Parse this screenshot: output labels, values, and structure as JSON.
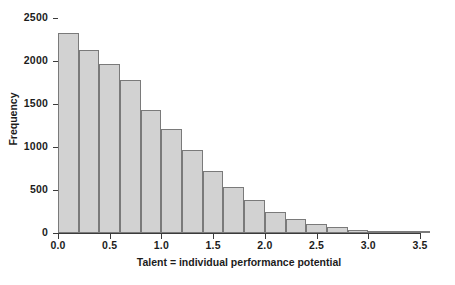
{
  "chart_data": {
    "type": "bar",
    "title": "",
    "subtitle": "",
    "xlabel": "Talent = individual performance potential",
    "ylabel": "Frequency",
    "xlim": [
      0.0,
      3.5
    ],
    "ylim": [
      0,
      2500
    ],
    "grid": false,
    "legend": null,
    "bin_width": 0.2,
    "x_tick_labels": [
      "0.0",
      "0.5",
      "1.0",
      "1.5",
      "2.0",
      "2.5",
      "3.0",
      "3.5"
    ],
    "x_tick_values": [
      0.0,
      0.5,
      1.0,
      1.5,
      2.0,
      2.5,
      3.0,
      3.5
    ],
    "y_tick_labels": [
      "0",
      "500",
      "1000",
      "1500",
      "2000",
      "2500"
    ],
    "y_tick_values": [
      0,
      500,
      1000,
      1500,
      2000,
      2500
    ],
    "bin_edges": [
      0.0,
      0.2,
      0.4,
      0.6,
      0.8,
      1.0,
      1.2,
      1.4,
      1.6,
      1.8,
      2.0,
      2.2,
      2.4,
      2.6,
      2.8,
      3.0,
      3.2,
      3.4,
      3.6
    ],
    "categories": [
      "0.0-0.2",
      "0.2-0.4",
      "0.4-0.6",
      "0.6-0.8",
      "0.8-1.0",
      "1.0-1.2",
      "1.2-1.4",
      "1.4-1.6",
      "1.6-1.8",
      "1.8-2.0",
      "2.0-2.2",
      "2.2-2.4",
      "2.4-2.6",
      "2.6-2.8",
      "2.8-3.0",
      "3.0-3.2",
      "3.2-3.4",
      "3.4-3.6"
    ],
    "values": [
      2325,
      2125,
      1960,
      1780,
      1430,
      1215,
      960,
      725,
      530,
      385,
      245,
      165,
      105,
      70,
      40,
      20,
      10,
      5
    ],
    "bar_fill_color": "#d2d2d2",
    "bar_edge_color": "#7a7a7a",
    "axis_color": "#3b3b3b",
    "background_color": "#ffffff"
  }
}
